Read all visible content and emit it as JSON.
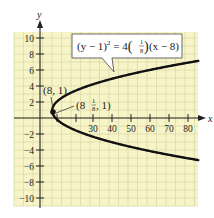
{
  "chart_data": {
    "type": "line",
    "title": "",
    "xlabel": "x",
    "ylabel": "y",
    "xlim": [
      -12,
      85
    ],
    "ylim": [
      -11,
      11
    ],
    "grid": true,
    "x_ticks": [
      30,
      40,
      50,
      60,
      70,
      80
    ],
    "y_ticks": [
      10,
      8,
      6,
      4,
      2,
      -2,
      -4,
      -6,
      -8,
      -10
    ],
    "x_tick_labels": [
      "30",
      "40",
      "50",
      "60",
      "70",
      "80"
    ],
    "y_tick_labels": [
      "10",
      "8",
      "6",
      "4",
      "2",
      "−2",
      "−4",
      "−6",
      "−8",
      "−10"
    ],
    "series": [
      {
        "name": "(y − 1)² = 4(1/8)(x − 8)",
        "equation": "(y-1)^2 = 4(1/8)(x-8)",
        "x_range": [
          8,
          85
        ],
        "points": [
          [
            85,
            7.2
          ],
          [
            70,
            6.57
          ],
          [
            50,
            5.58
          ],
          [
            30,
            4.32
          ],
          [
            20,
            3.45
          ],
          [
            12,
            2.41
          ],
          [
            9,
            1.71
          ],
          [
            8,
            1
          ],
          [
            9,
            0.29
          ],
          [
            12,
            -0.41
          ],
          [
            20,
            -1.45
          ],
          [
            30,
            -2.32
          ],
          [
            50,
            -3.58
          ],
          [
            70,
            -4.57
          ],
          [
            85,
            -5.2
          ]
        ]
      }
    ],
    "annotations": [
      {
        "text": "(8, 1)",
        "point": [
          8,
          1
        ],
        "label": "vertex"
      },
      {
        "text": "(8 1/8, 1)",
        "point": [
          8.125,
          1
        ],
        "label": "focus"
      },
      {
        "text": "(y − 1)² = 4(1/8)(x − 8)",
        "label": "equation-callout"
      }
    ],
    "colors": {
      "grid_background": "#f7f5c8",
      "grid_lines": "#d9d7a6",
      "curve": "#111111",
      "axis": "#222222"
    }
  },
  "labels": {
    "x_axis": "x",
    "y_axis": "y",
    "vertex_label": "(8, 1)",
    "focus_label_pre": "(8",
    "focus_label_num": "1",
    "focus_label_den": "8",
    "focus_label_post": ", 1)",
    "eq_part1": "(y − 1)",
    "eq_sup": "2",
    "eq_part2": " = 4",
    "eq_frac_num": "1",
    "eq_frac_den": "8",
    "eq_part3": "(x − 8)",
    "eq_paren_open": "(",
    "eq_paren_close": ")",
    "x_ticks": [
      "30",
      "40",
      "50",
      "60",
      "70",
      "80"
    ],
    "y_ticks": [
      "10",
      "8",
      "6",
      "4",
      "2",
      "−2",
      "−4",
      "−6",
      "−8",
      "−10"
    ]
  }
}
